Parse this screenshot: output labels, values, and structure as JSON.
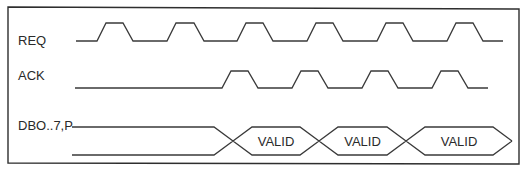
{
  "diagram": {
    "title": "",
    "colors": {
      "line": "#3a3a3a",
      "frame": "#2e2e2e",
      "text": "#2a2a2a",
      "background": "#ffffff"
    },
    "signals": [
      {
        "name": "REQ",
        "type": "clock",
        "label_pos": [
          18,
          45
        ],
        "low_y": 41,
        "high_y": 23,
        "start_x": 76,
        "end_x": 503,
        "pulses": [
          [
            97,
            106,
            123,
            133
          ],
          [
            167,
            176,
            194,
            204
          ],
          [
            237,
            246,
            263,
            273
          ],
          [
            307,
            316,
            333,
            343
          ],
          [
            377,
            386,
            403,
            413
          ],
          [
            447,
            456,
            473,
            483
          ]
        ]
      },
      {
        "name": "ACK",
        "type": "clock",
        "label_pos": [
          18,
          80
        ],
        "low_y": 88,
        "high_y": 71,
        "start_x": 75,
        "end_x": 488,
        "pulses": [
          [
            222,
            231,
            248,
            258
          ],
          [
            292,
            301,
            318,
            328
          ],
          [
            362,
            371,
            388,
            398
          ],
          [
            432,
            441,
            458,
            468
          ]
        ]
      },
      {
        "name": "DBO..7,P",
        "type": "bus",
        "label_pos": [
          18,
          130
        ],
        "top_y": 127,
        "bottom_y": 155,
        "start_x": 72,
        "invalid_end": 214,
        "crosses": [
          233,
          319,
          406
        ],
        "end_point": 512,
        "windows": [
          {
            "label": "VALID",
            "from": 233,
            "to": 319
          },
          {
            "label": "VALID",
            "from": 319,
            "to": 406
          },
          {
            "label": "VALID",
            "from": 406,
            "to": 512
          }
        ]
      }
    ]
  }
}
